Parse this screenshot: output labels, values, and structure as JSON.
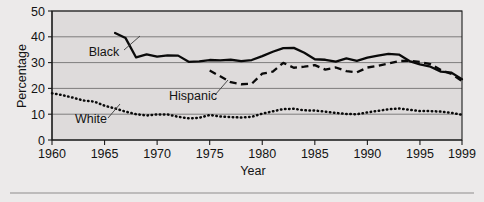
{
  "chart_data": {
    "type": "line",
    "title": "",
    "xlabel": "Year",
    "ylabel": "Percentage",
    "xlim": [
      1960,
      1999
    ],
    "ylim": [
      0,
      50
    ],
    "grid": true,
    "legend_position": "inline-annotations",
    "xticks": [
      1960,
      1965,
      1970,
      1975,
      1980,
      1985,
      1990,
      1995,
      1999
    ],
    "xtick_labels": [
      "1960",
      "1965",
      "1970",
      "1975",
      "1980",
      "1985",
      "1990",
      "1995",
      "1999"
    ],
    "yticks": [
      0,
      10,
      20,
      30,
      40,
      50
    ],
    "ytick_labels": [
      "0",
      "10",
      "20",
      "30",
      "40",
      "50"
    ],
    "series": [
      {
        "name": "Black",
        "style": "solid",
        "color": "#0a0a0a",
        "x": [
          1966,
          1967,
          1968,
          1969,
          1970,
          1971,
          1972,
          1973,
          1974,
          1975,
          1976,
          1977,
          1978,
          1979,
          1980,
          1981,
          1982,
          1983,
          1984,
          1985,
          1986,
          1987,
          1988,
          1989,
          1990,
          1991,
          1992,
          1993,
          1994,
          1995,
          1996,
          1997,
          1998,
          1999
        ],
        "values": [
          41.5,
          39.5,
          32.0,
          33.2,
          32.3,
          32.8,
          32.7,
          30.3,
          30.5,
          31.0,
          30.9,
          31.1,
          30.6,
          31.0,
          32.5,
          34.2,
          35.6,
          35.7,
          33.8,
          31.3,
          31.1,
          30.4,
          31.6,
          30.7,
          31.9,
          32.7,
          33.4,
          33.1,
          30.6,
          29.3,
          28.4,
          26.5,
          26.1,
          23.6
        ],
        "start_year": 1966,
        "end_year": 1999
      },
      {
        "name": "Hispanic",
        "style": "dashed",
        "color": "#0a0a0a",
        "x": [
          1975,
          1976,
          1977,
          1978,
          1979,
          1980,
          1981,
          1982,
          1983,
          1984,
          1985,
          1986,
          1987,
          1988,
          1989,
          1990,
          1991,
          1992,
          1993,
          1994,
          1995,
          1996,
          1997,
          1998,
          1999
        ],
        "values": [
          26.9,
          24.7,
          22.4,
          21.6,
          21.8,
          25.7,
          26.5,
          29.9,
          28.0,
          28.4,
          29.0,
          27.3,
          28.1,
          26.7,
          26.2,
          28.1,
          28.7,
          29.6,
          30.6,
          30.7,
          30.3,
          29.4,
          27.1,
          25.6,
          22.8
        ]
      },
      {
        "name": "White",
        "style": "dotted",
        "color": "#0a0a0a",
        "x": [
          1960,
          1961,
          1962,
          1963,
          1964,
          1965,
          1966,
          1967,
          1968,
          1969,
          1970,
          1971,
          1972,
          1973,
          1974,
          1975,
          1976,
          1977,
          1978,
          1979,
          1980,
          1981,
          1982,
          1983,
          1984,
          1985,
          1986,
          1987,
          1988,
          1989,
          1990,
          1991,
          1992,
          1993,
          1994,
          1995,
          1996,
          1997,
          1998,
          1999
        ],
        "values": [
          18.1,
          17.4,
          16.4,
          15.3,
          14.9,
          13.3,
          12.2,
          11.0,
          10.0,
          9.5,
          9.9,
          9.9,
          9.0,
          8.4,
          8.6,
          9.7,
          9.1,
          8.9,
          8.7,
          9.0,
          10.2,
          11.1,
          12.0,
          12.1,
          11.5,
          11.4,
          11.0,
          10.5,
          10.1,
          10.0,
          10.7,
          11.3,
          11.9,
          12.2,
          11.7,
          11.2,
          11.2,
          11.0,
          10.5,
          9.8
        ]
      }
    ],
    "annotations": [
      {
        "label": "Black",
        "x": 104,
        "y": 56
      },
      {
        "label": "Hispanic",
        "x": 193,
        "y": 100
      },
      {
        "label": "White",
        "x": 91,
        "y": 123
      }
    ]
  },
  "axis": {
    "y_title": "Percentage",
    "x_title": "Year"
  }
}
